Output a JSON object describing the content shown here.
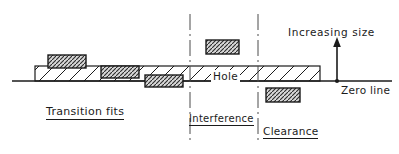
{
  "diagram": {
    "title_labels": {
      "hole": "Hole",
      "zero_line": "Zero line",
      "increasing_size": "Increasing size"
    },
    "zones": [
      {
        "id": "transition",
        "label": "Transition fits",
        "underlined": true
      },
      {
        "id": "interference",
        "label": "Interference",
        "underlined": true
      },
      {
        "id": "clearance",
        "label": "Clearance",
        "underlined": true
      }
    ],
    "colors": {
      "line": "#1b1b1b",
      "hatch": "#2a2a2a",
      "shaft_fill": "#d8d8d8",
      "background": "#ffffff"
    },
    "geometry": {
      "zero_line": {
        "x1": 12,
        "x2": 392,
        "y": 81
      },
      "hole_bar": {
        "x": 35,
        "y": 66,
        "width": 285,
        "height": 15
      },
      "divider_lines": [
        190,
        258
      ],
      "arrow": {
        "x": 337,
        "y_from": 81,
        "y_to": 40
      }
    },
    "shaft_blocks": [
      {
        "name": "shaft-block-1",
        "x": 48,
        "y": 55,
        "width": 38,
        "height": 13
      },
      {
        "name": "shaft-block-2",
        "x": 101,
        "y": 66,
        "width": 38,
        "height": 12
      },
      {
        "name": "shaft-block-3",
        "x": 145,
        "y": 75,
        "width": 38,
        "height": 12
      },
      {
        "name": "shaft-block-4",
        "x": 206,
        "y": 40,
        "width": 33,
        "height": 14
      },
      {
        "name": "shaft-block-5",
        "x": 266,
        "y": 88,
        "width": 34,
        "height": 14
      }
    ]
  }
}
